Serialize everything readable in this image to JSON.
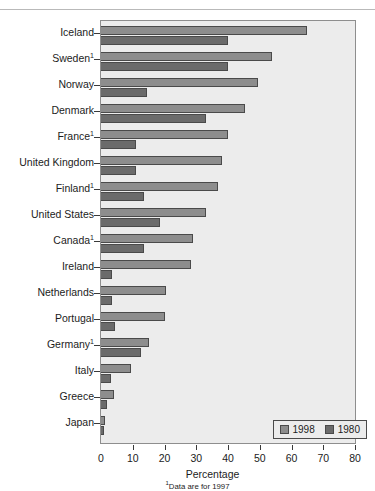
{
  "chart_data": {
    "type": "bar",
    "orientation": "horizontal",
    "title": "",
    "xlabel": "Percentage",
    "ylabel": "",
    "xlim": [
      0,
      80
    ],
    "xticks": [
      0,
      10,
      20,
      30,
      40,
      50,
      60,
      70,
      80
    ],
    "grid": false,
    "legend_position": "bottom-right",
    "footnote": "Data are for 1997",
    "footnote_marker": "1",
    "categories": [
      "Iceland",
      "Sweden",
      "Norway",
      "Denmark",
      "France",
      "United Kingdom",
      "Finland",
      "United States",
      "Canada",
      "Ireland",
      "Netherlands",
      "Portugal",
      "Germany",
      "Italy",
      "Greece",
      "Japan"
    ],
    "category_footnotes": [
      "",
      "1",
      "",
      "",
      "1",
      "",
      "1",
      "",
      "1",
      "",
      "",
      "",
      "1",
      "",
      "",
      ""
    ],
    "series": [
      {
        "name": "1998",
        "color": "#8d8d8d",
        "values": [
          65,
          54,
          49.5,
          45.5,
          40,
          38,
          37,
          33,
          29,
          28.5,
          20.5,
          20,
          15,
          9.5,
          4,
          1.2
        ]
      },
      {
        "name": "1980",
        "color": "#6b6b6b",
        "values": [
          40,
          40,
          14.5,
          33,
          11,
          11,
          13.5,
          18.5,
          13.5,
          3.5,
          3.5,
          4.5,
          12.5,
          3,
          2,
          1
        ]
      }
    ]
  }
}
